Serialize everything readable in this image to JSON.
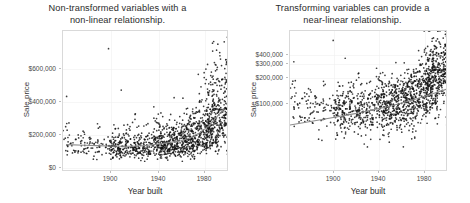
{
  "figure": {
    "width": 470,
    "height": 203,
    "background": "#ffffff",
    "point_color": "#111111",
    "trendline_color": "#8c8c8c",
    "panel_border_color": "#d9d9d9",
    "gridline_color": "#f0f0f0"
  },
  "panels": [
    {
      "id": "left",
      "title": "Non-transformed variables with a\nnon-linear relationship.",
      "xlabel": "Year built",
      "ylabel": "Sale price",
      "y_scale": "linear",
      "y_ticks": [
        "$0",
        "$200,000",
        "$400,000",
        "$600,000"
      ],
      "x_ticks": [
        "1900",
        "1940",
        "1980"
      ]
    },
    {
      "id": "right",
      "title": "Transforming variables can provide a\nnear-linear relationship.",
      "xlabel": "Year built",
      "ylabel": "Sale price",
      "y_scale": "log",
      "y_ticks": [
        "$100,000",
        "$200,000",
        "$300,000",
        "$400,000"
      ],
      "x_ticks": [
        "1900",
        "1940",
        "1980"
      ]
    }
  ],
  "chart_data": [
    {
      "type": "scatter",
      "panel": "left",
      "title": "Non-transformed variables with a non-linear relationship.",
      "xlabel": "Year built",
      "ylabel": "Sale price",
      "xlim": [
        1872,
        2010
      ],
      "ylim": [
        0,
        700000
      ],
      "x_ticks": [
        1900,
        1940,
        1980
      ],
      "y_ticks": [
        0,
        200000,
        400000,
        600000
      ],
      "y_tick_labels": [
        "$0",
        "$200,000",
        "$400,000",
        "$600,000"
      ],
      "y_scale": "linear",
      "grid": true,
      "legend": "none",
      "n_points": 1460,
      "trend": {
        "name": "loess smooth",
        "color": "#8c8c8c",
        "x": [
          1875,
          1890,
          1900,
          1910,
          1920,
          1930,
          1940,
          1950,
          1960,
          1970,
          1977,
          1985,
          1993,
          2000,
          2006
        ],
        "y": [
          136000,
          133000,
          131000,
          129000,
          128000,
          128000,
          131000,
          138000,
          146000,
          155000,
          168000,
          192000,
          228000,
          275000,
          312000
        ]
      },
      "description": "Sale price versus year built on a linear price axis; relationship curves upward sharply after ~1975, with dense clustering of homes built 1950-2010 and a long upper tail of prices above $400,000 among the newest homes."
    },
    {
      "type": "scatter",
      "panel": "right",
      "title": "Transforming variables can provide a near-linear relationship.",
      "xlabel": "Year built",
      "ylabel": "Sale price",
      "xlim": [
        1872,
        2010
      ],
      "ylim": [
        30000,
        760000
      ],
      "x_ticks": [
        1900,
        1940,
        1980
      ],
      "y_ticks": [
        100000,
        200000,
        300000,
        400000
      ],
      "y_tick_labels": [
        "$100,000",
        "$200,000",
        "$300,000",
        "$400,000"
      ],
      "y_scale": "log",
      "grid": true,
      "legend": "none",
      "n_points": 1460,
      "trend": {
        "name": "linear fit on log scale",
        "color": "#8c8c8c",
        "x": [
          1872,
          1900,
          1930,
          1960,
          1980,
          2000,
          2010
        ],
        "y": [
          88000,
          100000,
          115000,
          136000,
          157000,
          186000,
          202000
        ]
      },
      "description": "Same data with sale price on a log scale; the relationship becomes approximately linear and the fitted line rises steadily from about $88,000 for the oldest homes to roughly $200,000 for the newest."
    }
  ]
}
